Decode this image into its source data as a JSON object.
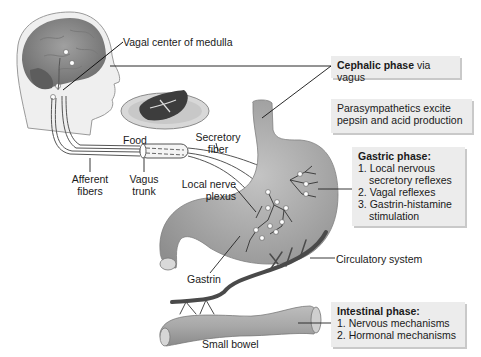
{
  "labels": {
    "vagal_center": "Vagal center of medulla",
    "food": "Food",
    "secretory_fiber_1": "Secretory",
    "secretory_fiber_2": "fiber",
    "afferent_1": "Afferent",
    "afferent_2": "fibers",
    "vagus_1": "Vagus",
    "vagus_2": "trunk",
    "local_nerve_1": "Local nerve",
    "local_nerve_2": "plexus",
    "gastrin": "Gastrin",
    "circulatory": "Circulatory system",
    "small_bowel": "Small bowel"
  },
  "boxes": {
    "cephalic": {
      "bold": "Cephalic phase",
      "rest": " via vagus"
    },
    "parasympathetic": {
      "line1": "Parasympathetics excite",
      "line2": "pepsin and acid production"
    },
    "gastric": {
      "title": "Gastric phase:",
      "items": [
        "1. Local nervous secretory reflexes",
        "2. Vagal reflexes",
        "3. Gastrin-histamine stimulation"
      ]
    },
    "intestinal": {
      "title": "Intestinal phase:",
      "items": [
        "1. Nervous mechanisms",
        "2. Hormonal mechanisms"
      ]
    }
  },
  "colors": {
    "box_bg": "#ececec",
    "organ_fill": "#a9a9a9",
    "vessel": "#4a4a4a"
  }
}
